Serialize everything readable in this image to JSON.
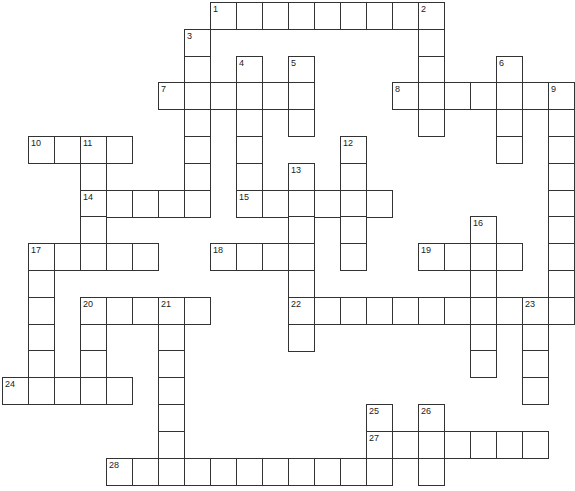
{
  "puzzle": {
    "type": "crossword",
    "rows": 18,
    "cols": 22,
    "entries": [
      {
        "number": 1,
        "direction": "across",
        "row": 0,
        "col": 8,
        "length": 9
      },
      {
        "number": 2,
        "direction": "down",
        "row": 0,
        "col": 16,
        "length": 5
      },
      {
        "number": 3,
        "direction": "down",
        "row": 1,
        "col": 7,
        "length": 7
      },
      {
        "number": 4,
        "direction": "down",
        "row": 2,
        "col": 9,
        "length": 6
      },
      {
        "number": 5,
        "direction": "down",
        "row": 2,
        "col": 11,
        "length": 3
      },
      {
        "number": 6,
        "direction": "down",
        "row": 2,
        "col": 19,
        "length": 4
      },
      {
        "number": 7,
        "direction": "across",
        "row": 3,
        "col": 6,
        "length": 6
      },
      {
        "number": 8,
        "direction": "across",
        "row": 3,
        "col": 15,
        "length": 7
      },
      {
        "number": 9,
        "direction": "down",
        "row": 3,
        "col": 21,
        "length": 9
      },
      {
        "number": 10,
        "direction": "across",
        "row": 5,
        "col": 1,
        "length": 4
      },
      {
        "number": 11,
        "direction": "down",
        "row": 5,
        "col": 3,
        "length": 4
      },
      {
        "number": 12,
        "direction": "down",
        "row": 5,
        "col": 13,
        "length": 5
      },
      {
        "number": 13,
        "direction": "down",
        "row": 6,
        "col": 11,
        "length": 7
      },
      {
        "number": 14,
        "direction": "across",
        "row": 7,
        "col": 3,
        "length": 5
      },
      {
        "number": 15,
        "direction": "across",
        "row": 7,
        "col": 9,
        "length": 6
      },
      {
        "number": 16,
        "direction": "down",
        "row": 8,
        "col": 18,
        "length": 6
      },
      {
        "number": 17,
        "direction": "across",
        "row": 9,
        "col": 1,
        "length": 5
      },
      {
        "number": 17,
        "direction": "down",
        "row": 9,
        "col": 1,
        "length": 6
      },
      {
        "number": 18,
        "direction": "across",
        "row": 9,
        "col": 8,
        "length": 4
      },
      {
        "number": 19,
        "direction": "across",
        "row": 9,
        "col": 16,
        "length": 4
      },
      {
        "number": 20,
        "direction": "across",
        "row": 11,
        "col": 3,
        "length": 5
      },
      {
        "number": 20,
        "direction": "down",
        "row": 11,
        "col": 3,
        "length": 4
      },
      {
        "number": 21,
        "direction": "down",
        "row": 11,
        "col": 6,
        "length": 7
      },
      {
        "number": 22,
        "direction": "across",
        "row": 11,
        "col": 11,
        "length": 11
      },
      {
        "number": 23,
        "direction": "down",
        "row": 11,
        "col": 20,
        "length": 4
      },
      {
        "number": 24,
        "direction": "across",
        "row": 14,
        "col": 0,
        "length": 5
      },
      {
        "number": 25,
        "direction": "down",
        "row": 15,
        "col": 14,
        "length": 3
      },
      {
        "number": 26,
        "direction": "down",
        "row": 15,
        "col": 16,
        "length": 3
      },
      {
        "number": 27,
        "direction": "across",
        "row": 16,
        "col": 14,
        "length": 7
      },
      {
        "number": 28,
        "direction": "across",
        "row": 17,
        "col": 4,
        "length": 11
      }
    ]
  }
}
